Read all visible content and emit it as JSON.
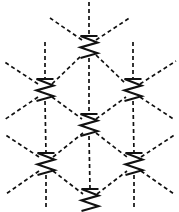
{
  "figure": {
    "background_color": "#ffffff",
    "stroke_color": "#111111",
    "width": 179,
    "height": 212
  },
  "geometry": {
    "lattice_type": "triangular",
    "columns": 3,
    "rows": 3,
    "column_spacing": 44,
    "row_spacing": 38,
    "node_glyph": "zigzag-z",
    "node_glyph_width": 17,
    "node_glyph_height": 22,
    "bond_directions": [
      "vertical",
      "diagonal-up-right",
      "diagonal-up-left"
    ],
    "bond_dash_pattern": "4 3",
    "bond_stroke_width": 1.7,
    "node_stroke_width": 2.1
  },
  "nodes": [
    {
      "id": "n-top-center",
      "label": "top-center site",
      "x": 89,
      "y": 47,
      "row": 0,
      "col": 1
    },
    {
      "id": "n-mid-left",
      "label": "middle-left site",
      "x": 45,
      "y": 90,
      "row": 1,
      "col": 0
    },
    {
      "id": "n-mid-right",
      "label": "middle-right site",
      "x": 133,
      "y": 90,
      "row": 1,
      "col": 2
    },
    {
      "id": "n-center",
      "label": "center site",
      "x": 89,
      "y": 125,
      "row": 2,
      "col": 1
    },
    {
      "id": "n-bottom-left",
      "label": "bottom-left site",
      "x": 46,
      "y": 164,
      "row": 3,
      "col": 0
    },
    {
      "id": "n-bottom-right",
      "label": "bottom-right site",
      "x": 134,
      "y": 164,
      "row": 3,
      "col": 2
    },
    {
      "id": "n-bottom-center",
      "label": "bottom-center site",
      "x": 90,
      "y": 200,
      "row": 4,
      "col": 1
    }
  ],
  "bonds": [
    {
      "id": "b-vert-top",
      "label": "vertical bond above top-center",
      "x1": 89,
      "y1": 2,
      "x2": 89,
      "y2": 36
    },
    {
      "id": "b-vert-midleft-up",
      "label": "vertical bond above middle-left",
      "x1": 45,
      "y1": 42,
      "x2": 45,
      "y2": 79
    },
    {
      "id": "b-vert-midright-up",
      "label": "vertical bond above middle-right",
      "x1": 133,
      "y1": 42,
      "x2": 133,
      "y2": 79
    },
    {
      "id": "b-vert-center-up",
      "label": "vertical bond top-center to center",
      "x1": 89,
      "y1": 58,
      "x2": 89,
      "y2": 114
    },
    {
      "id": "b-vert-midleft-down",
      "label": "vertical bond middle-left to bottom-left",
      "x1": 45,
      "y1": 101,
      "x2": 46,
      "y2": 153
    },
    {
      "id": "b-vert-midright-down",
      "label": "vertical bond middle-right to bottom-right",
      "x1": 133,
      "y1": 101,
      "x2": 134,
      "y2": 153
    },
    {
      "id": "b-vert-center-down",
      "label": "vertical bond center to bottom-center",
      "x1": 89,
      "y1": 136,
      "x2": 90,
      "y2": 189
    },
    {
      "id": "b-vert-bottomleft-down",
      "label": "vertical bond below bottom-left",
      "x1": 46,
      "y1": 175,
      "x2": 46,
      "y2": 209
    },
    {
      "id": "b-vert-bottomright-down",
      "label": "vertical bond below bottom-right",
      "x1": 134,
      "y1": 175,
      "x2": 134,
      "y2": 209
    },
    {
      "id": "b-diag-tc-ur",
      "label": "diagonal up-right from top-center",
      "x1": 96,
      "y1": 40,
      "x2": 131,
      "y2": 17
    },
    {
      "id": "b-diag-tc-ul",
      "label": "diagonal up-left from top-center",
      "x1": 82,
      "y1": 40,
      "x2": 50,
      "y2": 18
    },
    {
      "id": "b-diag-ml-ul",
      "label": "diagonal up-left from middle-left",
      "x1": 38,
      "y1": 84,
      "x2": 3,
      "y2": 61
    },
    {
      "id": "b-diag-mr-ur",
      "label": "diagonal up-right from middle-right",
      "x1": 140,
      "y1": 84,
      "x2": 176,
      "y2": 61
    },
    {
      "id": "b-diag-ml-tc",
      "label": "diagonal middle-left to top-center",
      "x1": 52,
      "y1": 84,
      "x2": 82,
      "y2": 55
    },
    {
      "id": "b-diag-tc-mr",
      "label": "diagonal top-center to middle-right",
      "x1": 96,
      "y1": 55,
      "x2": 126,
      "y2": 84
    },
    {
      "id": "b-diag-ml-ct",
      "label": "diagonal middle-left to center",
      "x1": 52,
      "y1": 97,
      "x2": 82,
      "y2": 119
    },
    {
      "id": "b-diag-ct-mr",
      "label": "diagonal center to middle-right",
      "x1": 96,
      "y1": 119,
      "x2": 126,
      "y2": 97
    },
    {
      "id": "b-diag-ml-dl",
      "label": "diagonal down-left from middle-left",
      "x1": 38,
      "y1": 97,
      "x2": 4,
      "y2": 120
    },
    {
      "id": "b-diag-mr-dr",
      "label": "diagonal down-right from middle-right",
      "x1": 140,
      "y1": 97,
      "x2": 175,
      "y2": 120
    },
    {
      "id": "b-diag-bl-ct",
      "label": "diagonal bottom-left to center",
      "x1": 53,
      "y1": 157,
      "x2": 83,
      "y2": 133
    },
    {
      "id": "b-diag-ct-br",
      "label": "diagonal center to bottom-right",
      "x1": 96,
      "y1": 133,
      "x2": 127,
      "y2": 157
    },
    {
      "id": "b-diag-bl-ul",
      "label": "diagonal up-left from bottom-left",
      "x1": 39,
      "y1": 157,
      "x2": 4,
      "y2": 134
    },
    {
      "id": "b-diag-br-ur",
      "label": "diagonal up-right from bottom-right",
      "x1": 141,
      "y1": 157,
      "x2": 176,
      "y2": 134
    },
    {
      "id": "b-diag-bl-bc",
      "label": "diagonal bottom-left to bottom-center",
      "x1": 53,
      "y1": 171,
      "x2": 83,
      "y2": 194
    },
    {
      "id": "b-diag-bc-br",
      "label": "diagonal bottom-center to bottom-right",
      "x1": 97,
      "y1": 194,
      "x2": 127,
      "y2": 171
    },
    {
      "id": "b-diag-bl-dl",
      "label": "diagonal down-left from bottom-left",
      "x1": 39,
      "y1": 171,
      "x2": 6,
      "y2": 194
    },
    {
      "id": "b-diag-br-dr",
      "label": "diagonal down-right from bottom-right",
      "x1": 141,
      "y1": 171,
      "x2": 174,
      "y2": 194
    }
  ]
}
